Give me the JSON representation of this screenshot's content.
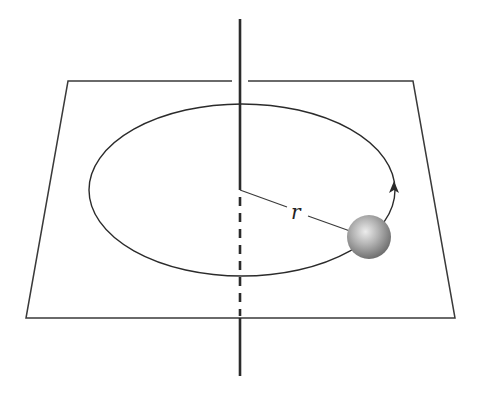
{
  "diagram": {
    "labels": {
      "radius": "r"
    },
    "colors": {
      "stroke": "#2b2b2b",
      "ball_highlight": "#e8e8e8",
      "ball_mid": "#a8a8a8",
      "ball_edge": "#6a6a6a",
      "background": "#ffffff"
    },
    "elements": [
      "horizontal-plane",
      "vertical-axis",
      "circular-path",
      "direction-arrow",
      "radius-line",
      "ball"
    ]
  }
}
